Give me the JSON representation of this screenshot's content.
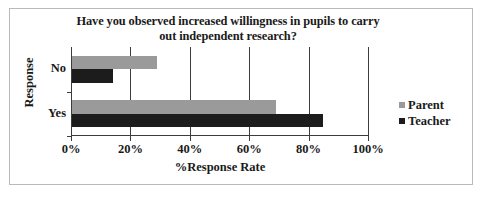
{
  "chart_data": {
    "type": "bar",
    "orientation": "horizontal",
    "title": "Have you observed increased willingness in pupils to carry out independent research?",
    "title_line1": "Have you observed increased willingness in pupils to carry",
    "title_line2": "out independent research?",
    "xlabel": "%Response Rate",
    "ylabel": "Response",
    "categories": [
      "No",
      "Yes"
    ],
    "series": [
      {
        "name": "Parent",
        "color": "#9a9a9a",
        "values": [
          29,
          69
        ]
      },
      {
        "name": "Teacher",
        "color": "#1c1c1c",
        "values": [
          14,
          85
        ]
      }
    ],
    "xlim": [
      0,
      100
    ],
    "xticks": [
      0,
      20,
      40,
      60,
      80,
      100
    ],
    "xtick_labels": [
      "0%",
      "20%",
      "40%",
      "60%",
      "80%",
      "100%"
    ],
    "grid": "vertical",
    "legend_position": "right",
    "legend": [
      {
        "label": "Parent",
        "color": "#9a9a9a"
      },
      {
        "label": "Teacher",
        "color": "#1c1c1c"
      }
    ],
    "border_color": "#b9b9b9",
    "axis_color": "#3c3c3c"
  }
}
